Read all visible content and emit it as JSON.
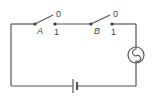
{
  "diagram": {
    "type": "circuit",
    "colors": {
      "wire": "#555555",
      "background": "#ffffff"
    },
    "switches": [
      {
        "id": "A",
        "label": "A",
        "position_open": "0",
        "position_closed": "1"
      },
      {
        "id": "B",
        "label": "B",
        "position_open": "0",
        "position_closed": "1"
      }
    ],
    "components": [
      "switch-A",
      "switch-B",
      "lamp",
      "battery"
    ]
  }
}
